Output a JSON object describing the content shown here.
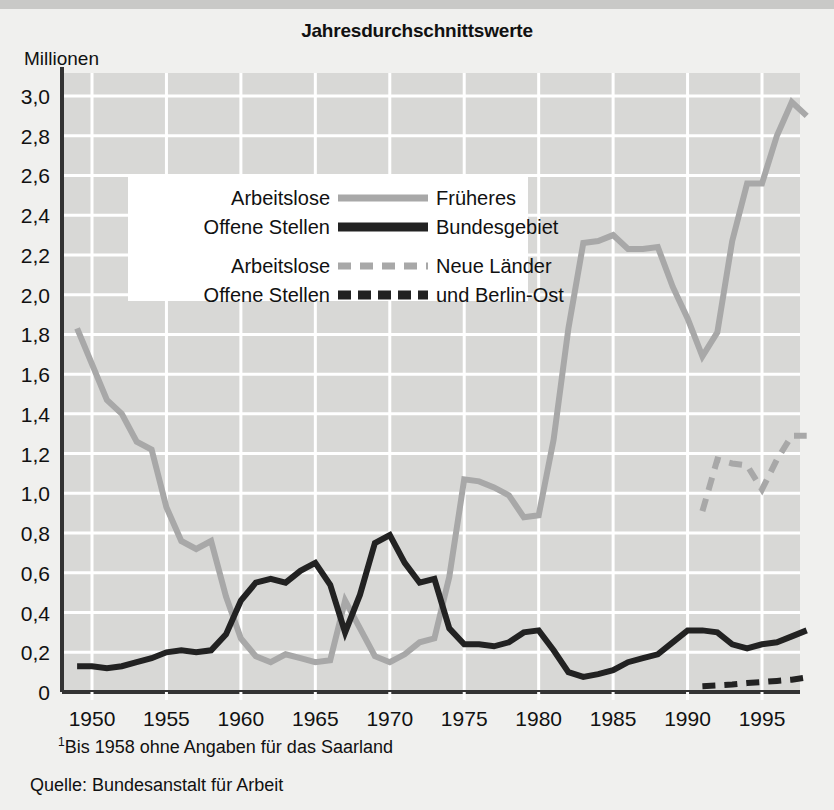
{
  "header": {
    "title": "Jahresdurchschnittswerte",
    "unit_label": "Millionen"
  },
  "footnotes": {
    "marker": "1",
    "saarland": "Bis 1958 ohne Angaben für das Saarland",
    "source": "Quelle: Bundesanstalt für Arbeit"
  },
  "legend": {
    "entries": [
      {
        "left": "Arbeitslose",
        "right": "Früheres",
        "style": "solid",
        "color": "#a8a8a8"
      },
      {
        "left": "Offene Stellen",
        "right": "Bundesgebiet",
        "style": "solid",
        "color": "#222222"
      },
      {
        "left": "Arbeitslose",
        "right": "Neue Länder",
        "style": "dashed",
        "color": "#a8a8a8"
      },
      {
        "left": "Offene Stellen",
        "right": "und Berlin-Ost",
        "style": "dashed",
        "color": "#222222"
      }
    ]
  },
  "colors": {
    "background": "#f0f0ee",
    "plot_background": "#d8d8d6",
    "gridline": "#ffffff",
    "axis": "#333333",
    "west_unemployed": "#a8a8a8",
    "west_vacancies": "#222222",
    "east_unemployed": "#a8a8a8",
    "east_vacancies": "#222222"
  },
  "chart_data": {
    "type": "line",
    "title": "Jahresdurchschnittswerte",
    "subtitle": "",
    "xlabel": "",
    "ylabel": "Millionen",
    "xlim": [
      1949,
      1998
    ],
    "ylim": [
      0,
      3.1
    ],
    "ytick_values": [
      0,
      0.2,
      0.4,
      0.6,
      0.8,
      1.0,
      1.2,
      1.4,
      1.6,
      1.8,
      2.0,
      2.2,
      2.4,
      2.6,
      2.8,
      3.0
    ],
    "ytick_labels": [
      "0",
      "0,2",
      "0,4",
      "0,6",
      "0,8",
      "1,0",
      "1,2",
      "1,4",
      "1,6",
      "1,8",
      "2,0",
      "2,2",
      "2,4",
      "2,6",
      "2,8",
      "3,0"
    ],
    "xtick_values": [
      1950,
      1955,
      1960,
      1965,
      1970,
      1975,
      1980,
      1985,
      1990,
      1995
    ],
    "xtick_labels": [
      "1950",
      "1955",
      "1960",
      "1965",
      "1970",
      "1975",
      "1980",
      "1985",
      "1990",
      "1995"
    ],
    "grid": true,
    "legend_position": "upper-left-inside",
    "series": [
      {
        "name": "Arbeitslose – Früheres Bundesgebiet",
        "style": "solid",
        "color": "#a8a8a8",
        "x": [
          1949,
          1950,
          1951,
          1952,
          1953,
          1954,
          1955,
          1956,
          1957,
          1958,
          1959,
          1960,
          1961,
          1962,
          1963,
          1964,
          1965,
          1966,
          1967,
          1968,
          1969,
          1970,
          1971,
          1972,
          1973,
          1974,
          1975,
          1976,
          1977,
          1978,
          1979,
          1980,
          1981,
          1982,
          1983,
          1984,
          1985,
          1986,
          1987,
          1988,
          1989,
          1990,
          1991,
          1992,
          1993,
          1994,
          1995,
          1996,
          1997,
          1998
        ],
        "y": [
          1.83,
          1.65,
          1.47,
          1.4,
          1.26,
          1.22,
          0.93,
          0.76,
          0.72,
          0.76,
          0.48,
          0.27,
          0.18,
          0.15,
          0.19,
          0.17,
          0.15,
          0.16,
          0.46,
          0.32,
          0.18,
          0.15,
          0.19,
          0.25,
          0.27,
          0.58,
          1.07,
          1.06,
          1.03,
          0.99,
          0.88,
          0.89,
          1.27,
          1.83,
          2.26,
          2.27,
          2.3,
          2.23,
          2.23,
          2.24,
          2.04,
          1.88,
          1.69,
          1.81,
          2.27,
          2.56,
          2.56,
          2.8,
          2.97,
          2.9
        ]
      },
      {
        "name": "Offene Stellen – Früheres Bundesgebiet",
        "style": "solid",
        "color": "#222222",
        "x": [
          1949,
          1950,
          1951,
          1952,
          1953,
          1954,
          1955,
          1956,
          1957,
          1958,
          1959,
          1960,
          1961,
          1962,
          1963,
          1964,
          1965,
          1966,
          1967,
          1968,
          1969,
          1970,
          1971,
          1972,
          1973,
          1974,
          1975,
          1976,
          1977,
          1978,
          1979,
          1980,
          1981,
          1982,
          1983,
          1984,
          1985,
          1986,
          1987,
          1988,
          1989,
          1990,
          1991,
          1992,
          1993,
          1994,
          1995,
          1996,
          1997,
          1998
        ],
        "y": [
          0.13,
          0.13,
          0.12,
          0.13,
          0.15,
          0.17,
          0.2,
          0.21,
          0.2,
          0.21,
          0.29,
          0.46,
          0.55,
          0.57,
          0.55,
          0.61,
          0.65,
          0.54,
          0.3,
          0.49,
          0.75,
          0.79,
          0.65,
          0.55,
          0.57,
          0.32,
          0.24,
          0.24,
          0.23,
          0.25,
          0.3,
          0.31,
          0.21,
          0.1,
          0.076,
          0.09,
          0.11,
          0.15,
          0.17,
          0.19,
          0.25,
          0.31,
          0.31,
          0.3,
          0.24,
          0.22,
          0.24,
          0.25,
          0.28,
          0.31
        ]
      },
      {
        "name": "Arbeitslose – Neue Länder und Berlin-Ost",
        "style": "dashed",
        "color": "#a8a8a8",
        "x": [
          1991,
          1992,
          1993,
          1994,
          1995,
          1996,
          1997,
          1998
        ],
        "y": [
          0.91,
          1.17,
          1.15,
          1.14,
          1.02,
          1.17,
          1.29,
          1.29
        ]
      },
      {
        "name": "Offene Stellen – Neue Länder und Berlin-Ost",
        "style": "dashed",
        "color": "#222222",
        "x": [
          1991,
          1992,
          1993,
          1994,
          1995,
          1996,
          1997,
          1998
        ],
        "y": [
          0.029,
          0.033,
          0.038,
          0.045,
          0.05,
          0.056,
          0.062,
          0.073
        ]
      }
    ]
  }
}
